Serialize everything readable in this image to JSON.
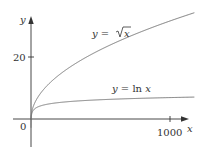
{
  "chart_data": {
    "type": "line",
    "title": "",
    "xlabel": "x",
    "ylabel": "y",
    "xlim": [
      -120,
      1180
    ],
    "ylim": [
      -9,
      33
    ],
    "x_ticks": [
      {
        "value": 1000,
        "label": "1000"
      }
    ],
    "y_ticks": [
      {
        "value": 20,
        "label": "20"
      }
    ],
    "origin_label": "0",
    "grid": false,
    "legend": "none (inline curve labels)",
    "series": [
      {
        "name": "y = √x",
        "function": "sqrt(x)",
        "x": [
          0,
          1,
          10,
          50,
          100,
          200,
          400,
          600,
          800,
          1000,
          1175
        ],
        "values": [
          0,
          1,
          3.16,
          7.07,
          10,
          14.14,
          20,
          24.49,
          28.28,
          31.62,
          34.28
        ]
      },
      {
        "name": "y = ln x",
        "function": "ln(x)",
        "x": [
          1,
          10,
          50,
          100,
          200,
          400,
          600,
          800,
          1000,
          1175
        ],
        "values": [
          0,
          2.3,
          3.91,
          4.61,
          5.3,
          5.99,
          6.4,
          6.68,
          6.91,
          7.07
        ]
      }
    ],
    "annotations": [
      {
        "text": "y = √x",
        "near": "upper curve"
      },
      {
        "text": "y = ln x",
        "near": "lower curve"
      }
    ]
  },
  "labels": {
    "y_axis": "y",
    "x_axis": "x",
    "origin": "0",
    "tick_y_20": "20",
    "tick_x_1000": "1000",
    "sqrt_prefix": "y = ",
    "sqrt_arg": "x",
    "ln_label_prefix": "y = ln ",
    "ln_label_arg": "x"
  },
  "colors": {
    "axis": "#333333",
    "curve": "#777777",
    "text": "#333333"
  }
}
